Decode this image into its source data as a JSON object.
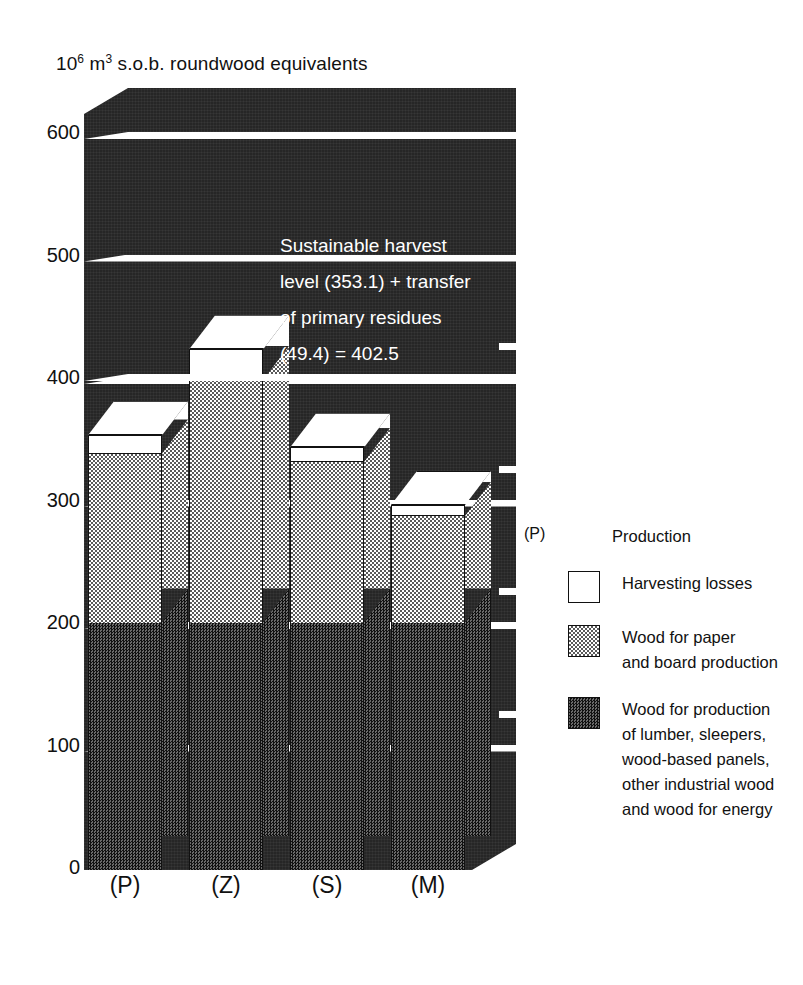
{
  "chart_data": {
    "type": "bar",
    "title_parts": {
      "base1": "10",
      "sup1": "6",
      "mid": " m",
      "sup2": "3",
      "rest": " s.o.b. roundwood equivalents"
    },
    "xlabel": "",
    "ylabel": "10^6 m^3 s.o.b. roundwood equivalents",
    "ylim": [
      0,
      600
    ],
    "yticks": [
      0,
      100,
      200,
      300,
      400,
      500,
      600
    ],
    "ytick_labels": [
      "0",
      "100",
      "200",
      "300",
      "400",
      "500",
      "600"
    ],
    "grid": true,
    "legend_position": "right",
    "stacked": true,
    "categories": [
      "(P)",
      "(Z)",
      "(S)",
      "(M)"
    ],
    "series": [
      {
        "name": "Wood for production of lumber, sleepers, wood-based panels, other industrial wood and wood for energy",
        "key": "dark",
        "values": [
          202,
          202,
          202,
          202
        ]
      },
      {
        "name": "Wood for paper and board production",
        "key": "light",
        "values": [
          138,
          198,
          131,
          87
        ]
      },
      {
        "name": "Harvesting losses",
        "key": "white",
        "values": [
          15,
          25,
          12,
          9
        ]
      }
    ],
    "totals": [
      355,
      425,
      345,
      298
    ],
    "reference_line": {
      "value": 402.5,
      "label": "Sustainable harvest level (353.1) + transfer of primary residues (49.4) = 402.5"
    },
    "annotation_lines": [
      "Sustainable harvest",
      "level (353.1) + transfer",
      "of primary residues",
      "(49.4)  = 402.5"
    ]
  },
  "legend": {
    "rows": [
      {
        "key_text": "(P)",
        "swatch": "none",
        "lines": [
          "Production"
        ]
      },
      {
        "key_text": "",
        "swatch": "white",
        "lines": [
          "Harvesting losses"
        ]
      },
      {
        "key_text": "",
        "swatch": "light",
        "lines": [
          "Wood for paper",
          "and board production"
        ]
      },
      {
        "key_text": "",
        "swatch": "dark",
        "lines": [
          "Wood for production",
          "of lumber, sleepers,",
          "wood-based panels,",
          "other industrial wood",
          "and wood for energy"
        ]
      }
    ]
  },
  "colors": {
    "wall": "#262626",
    "white_segment": "#ffffff",
    "light_segment": "#d8d8d8",
    "dark_segment": "#3a3a3a",
    "text": "#111111",
    "annotation_text": "#ffffff"
  }
}
